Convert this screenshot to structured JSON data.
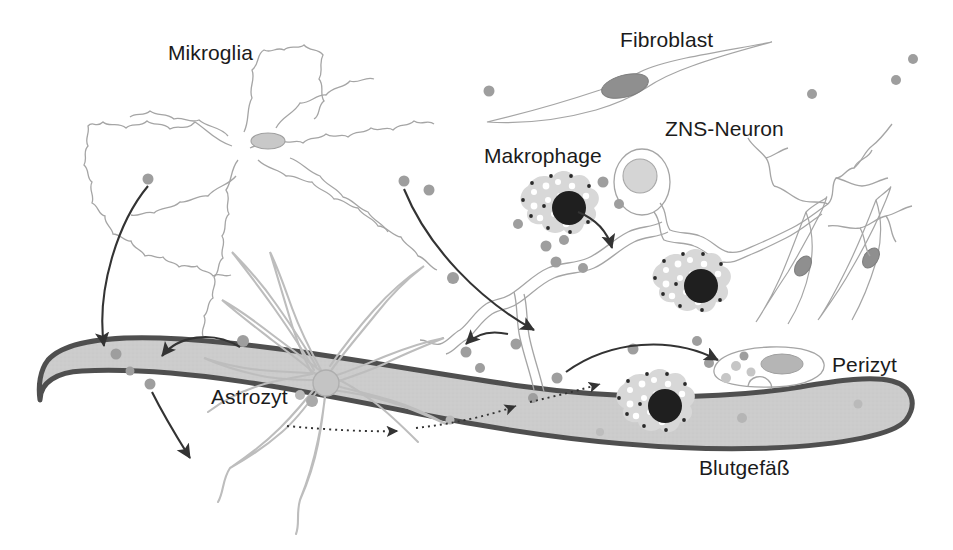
{
  "figure": {
    "kind": "scientific-diagram",
    "language": "de",
    "width": 953,
    "height": 550,
    "background_color": "#ffffff"
  },
  "labels": {
    "mikroglia": "Mikroglia",
    "fibroblast": "Fibroblast",
    "zns_neuron": "ZNS-Neuron",
    "makrophage": "Makrophage",
    "astrozyt": "Astrozyt",
    "perizyt": "Perizyt",
    "blutgefaess": "Blutgefäß"
  },
  "colors": {
    "label_text": "#1b1b1b",
    "cell_outline": "#9a9a9a",
    "vessel_fill": "#cccccc",
    "vessel_outline": "#4f4f4f",
    "arrow": "#333333",
    "signal_dot": "#9e9e9e",
    "macrophage_cytoplasm": "#d8d8d8",
    "macrophage_nucleus": "#1f1f1f",
    "nucleus_light": "#d0d0d0",
    "nucleus_mid": "#8f8f8f"
  },
  "cells": [
    {
      "name": "mikroglia",
      "label": "Mikroglia",
      "description": "ramified microglial cell with highly branched spiky processes and small oval nucleus",
      "nucleus_color": "#c8c8c8"
    },
    {
      "name": "fibroblast",
      "label": "Fibroblast",
      "description": "elongated spindle-shaped cell with dark oval nucleus",
      "count": 3,
      "nucleus_color": "#8f8f8f"
    },
    {
      "name": "zns-neuron",
      "label": "ZNS-Neuron",
      "description": "central nervous system neuron with oval soma, light nucleus and long branching axon",
      "nucleus_color": "#d5d5d5"
    },
    {
      "name": "makrophage",
      "label": "Makrophage",
      "description": "amoeboid macrophage with vacuolated cytoplasm and large dark nucleus",
      "count": 3,
      "nucleus_color": "#1f1f1f"
    },
    {
      "name": "astrozyt",
      "label": "Astrozyt",
      "description": "star-shaped astrocyte with many tapering endfeet contacting the blood vessel",
      "nucleus_color": "#c4c4c4"
    },
    {
      "name": "perizyt",
      "label": "Perizyt",
      "description": "flat pericyte wrapped on the outer surface of the blood vessel",
      "nucleus_color": "#b5b5b5"
    },
    {
      "name": "blutgefaess",
      "label": "Blutgefäß",
      "description": "blood vessel drawn as a thick curved gray band with dark outline crossing the lower image"
    }
  ],
  "annotations": {
    "solid_arrows": 7,
    "dotted_arrows": 3,
    "signal_dots": 28,
    "meaning": "arrows indicate signalling / migration directions between cell types and the blood vessel"
  }
}
